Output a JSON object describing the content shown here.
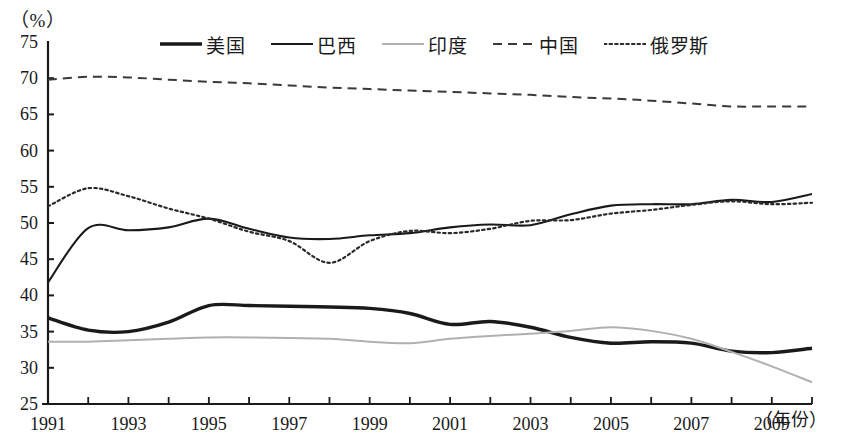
{
  "chart_data": {
    "type": "line",
    "title": "",
    "unit_label": "（%）",
    "xlabel": "（年份）",
    "ylabel": "",
    "xlim": [
      1991,
      2010
    ],
    "ylim": [
      25,
      75
    ],
    "ytick_step": 5,
    "yticks": [
      25,
      30,
      35,
      40,
      45,
      50,
      55,
      60,
      65,
      70,
      75
    ],
    "xticks": [
      1991,
      1992,
      1993,
      1994,
      1995,
      1996,
      1997,
      1998,
      1999,
      2000,
      2001,
      2002,
      2003,
      2004,
      2005,
      2006,
      2007,
      2008,
      2009,
      2010
    ],
    "xtick_labels": [
      "1991",
      "",
      "1993",
      "",
      "1995",
      "",
      "1997",
      "",
      "1999",
      "",
      "2001",
      "",
      "2003",
      "",
      "2005",
      "",
      "2007",
      "",
      "2009",
      ""
    ],
    "grid": false,
    "legend_position": "top-center",
    "x": [
      1991,
      1992,
      1993,
      1994,
      1995,
      1996,
      1997,
      1998,
      1999,
      2000,
      2001,
      2002,
      2003,
      2004,
      2005,
      2006,
      2007,
      2008,
      2009,
      2010
    ],
    "series": [
      {
        "name": "美国",
        "style": "solid-thick",
        "color": "#1a1a1a",
        "values": [
          36.9,
          35.2,
          35.0,
          36.3,
          38.6,
          38.6,
          38.5,
          38.4,
          38.2,
          37.5,
          36.0,
          36.4,
          35.6,
          34.2,
          33.4,
          33.6,
          33.4,
          32.3,
          32.1,
          32.7
        ]
      },
      {
        "name": "巴西",
        "style": "solid-thin",
        "color": "#1a1a1a",
        "values": [
          41.8,
          49.3,
          49.0,
          49.4,
          50.6,
          49.2,
          48.0,
          47.8,
          48.3,
          48.6,
          49.4,
          49.8,
          49.7,
          51.2,
          52.4,
          52.6,
          52.6,
          53.2,
          52.9,
          54.0
        ]
      },
      {
        "name": "印度",
        "style": "solid-light",
        "color": "#b0b0b0",
        "values": [
          33.6,
          33.6,
          33.8,
          34.0,
          34.2,
          34.2,
          34.1,
          34.0,
          33.6,
          33.4,
          34.0,
          34.4,
          34.7,
          35.1,
          35.6,
          35.1,
          34.0,
          32.2,
          30.2,
          28.0
        ]
      },
      {
        "name": "中国",
        "style": "dashed",
        "color": "#3a3a3a",
        "values": [
          69.8,
          70.2,
          70.1,
          69.8,
          69.5,
          69.3,
          69.0,
          68.7,
          68.5,
          68.3,
          68.1,
          67.9,
          67.7,
          67.4,
          67.2,
          66.9,
          66.5,
          66.1,
          66.1,
          66.1
        ]
      },
      {
        "name": "俄罗斯",
        "style": "dotted",
        "color": "#2a2a2a",
        "values": [
          52.3,
          54.8,
          53.7,
          52.0,
          50.6,
          48.8,
          47.5,
          44.5,
          47.5,
          48.9,
          48.6,
          49.2,
          50.3,
          50.4,
          51.3,
          51.8,
          52.5,
          53.0,
          52.6,
          52.8
        ]
      }
    ]
  },
  "legend": {
    "items": [
      {
        "label": "美国",
        "style": "solid-thick"
      },
      {
        "label": "巴西",
        "style": "solid-thin"
      },
      {
        "label": "印度",
        "style": "solid-light"
      },
      {
        "label": "中国",
        "style": "dashed"
      },
      {
        "label": "俄罗斯",
        "style": "dotted"
      }
    ]
  }
}
